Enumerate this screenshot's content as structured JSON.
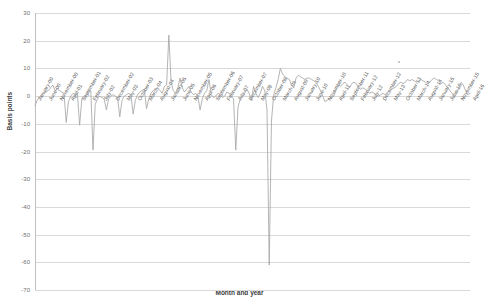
{
  "chart_data": {
    "type": "line",
    "title": "",
    "xlabel": "Month and year",
    "ylabel": "Basis points",
    "ylim": [
      -70,
      30
    ],
    "ytick_values": [
      30,
      20,
      10,
      0,
      -10,
      -20,
      -30,
      -40,
      -50,
      -60,
      -70
    ],
    "ytick_labels": [
      "30",
      "20",
      "10",
      "0",
      "-10",
      "-20",
      "-30",
      "-40",
      "-50",
      "-60",
      "-70"
    ],
    "grid": true,
    "legend": "none",
    "series_name": "Spread",
    "series_color": "#a6a6a6",
    "x_tick_interval_months": 5,
    "xtick_labels": [
      "January-00",
      "June-00",
      "November-00",
      "April-01",
      "September-01",
      "February-02",
      "July-02",
      "December-02",
      "May-03",
      "October-03",
      "March-04",
      "August-04",
      "January-05",
      "June-05",
      "November-05",
      "April-06",
      "September-06",
      "February-07",
      "July-07",
      "December-07",
      "May-08",
      "October-08",
      "March-09",
      "August-09",
      "January-10",
      "June-10",
      "November-10",
      "April-11",
      "September-11",
      "February-12",
      "July-12",
      "December-12",
      "May-13",
      "October-13",
      "March-14",
      "August-14",
      "January-15",
      "June-15",
      "November-15",
      "April-16"
    ],
    "x": [
      "January-00",
      "February-00",
      "March-00",
      "April-00",
      "May-00",
      "June-00",
      "July-00",
      "August-00",
      "September-00",
      "October-00",
      "November-00",
      "December-00",
      "January-01",
      "February-01",
      "March-01",
      "April-01",
      "May-01",
      "June-01",
      "July-01",
      "August-01",
      "September-01",
      "October-01",
      "November-01",
      "December-01",
      "January-02",
      "February-02",
      "March-02",
      "April-02",
      "May-02",
      "June-02",
      "July-02",
      "August-02",
      "September-02",
      "October-02",
      "November-02",
      "December-02",
      "January-03",
      "February-03",
      "March-03",
      "April-03",
      "May-03",
      "June-03",
      "July-03",
      "August-03",
      "September-03",
      "October-03",
      "November-03",
      "December-03",
      "January-04",
      "February-04",
      "March-04",
      "April-04",
      "May-04",
      "June-04",
      "July-04",
      "August-04",
      "September-04",
      "October-04",
      "November-04",
      "December-04",
      "January-05",
      "February-05",
      "March-05",
      "April-05",
      "May-05",
      "June-05",
      "July-05",
      "August-05",
      "September-05",
      "October-05",
      "November-05",
      "December-05",
      "January-06",
      "February-06",
      "March-06",
      "April-06",
      "May-06",
      "June-06",
      "July-06",
      "August-06",
      "September-06",
      "October-06",
      "November-06",
      "December-06",
      "January-07",
      "February-07",
      "March-07",
      "April-07",
      "May-07",
      "June-07",
      "July-07",
      "August-07",
      "September-07",
      "October-07",
      "November-07",
      "December-07",
      "January-08",
      "February-08",
      "March-08",
      "April-08",
      "May-08",
      "June-08",
      "July-08",
      "August-08",
      "September-08",
      "October-08",
      "November-08",
      "December-08",
      "January-09",
      "February-09",
      "March-09",
      "April-09",
      "May-09",
      "June-09",
      "July-09",
      "August-09",
      "September-09",
      "October-09",
      "November-09",
      "December-09",
      "January-10",
      "February-10",
      "March-10",
      "April-10",
      "May-10",
      "June-10",
      "July-10",
      "August-10",
      "September-10",
      "October-10",
      "November-10",
      "December-10",
      "January-11",
      "February-11",
      "March-11",
      "April-11",
      "May-11",
      "June-11",
      "July-11",
      "August-11",
      "September-11",
      "October-11",
      "November-11",
      "December-11",
      "January-12",
      "February-12",
      "March-12",
      "April-12",
      "May-12",
      "June-12",
      "July-12",
      "August-12",
      "September-12",
      "October-12",
      "November-12",
      "December-12",
      "January-13",
      "February-13",
      "March-13",
      "April-13",
      "May-13",
      "June-13",
      "July-13",
      "August-13",
      "September-13",
      "October-13",
      "November-13",
      "December-13",
      "January-14",
      "February-14",
      "March-14",
      "April-14",
      "May-14",
      "June-14",
      "July-14",
      "August-14",
      "September-14",
      "October-14",
      "November-14",
      "December-14",
      "January-15",
      "February-15",
      "March-15",
      "April-15",
      "May-15",
      "June-15",
      "July-15",
      "August-15",
      "September-15",
      "October-15",
      "November-15",
      "December-15",
      "January-16",
      "February-16",
      "March-16",
      "April-16"
    ],
    "values": [
      -3.5,
      -1.5,
      -0.5,
      0.5,
      1.0,
      1.5,
      2.0,
      3.0,
      4.0,
      2.0,
      2.5,
      2.0,
      1.5,
      1.0,
      -9.5,
      -2.0,
      0.0,
      1.0,
      0.5,
      1.0,
      -10.5,
      -1.0,
      0.0,
      0.5,
      1.5,
      2.0,
      -19.5,
      -3.0,
      -1.0,
      0.0,
      -0.5,
      -1.0,
      -5.0,
      -1.0,
      0.0,
      0.5,
      0.0,
      -0.5,
      -7.5,
      -1.5,
      0.0,
      0.5,
      1.0,
      0.5,
      -6.5,
      -1.5,
      0.5,
      1.5,
      2.0,
      2.5,
      -4.5,
      -1.0,
      1.0,
      2.0,
      2.5,
      3.0,
      2.0,
      1.0,
      3.5,
      4.0,
      22.0,
      5.0,
      2.0,
      1.0,
      3.0,
      6.5,
      3.0,
      1.5,
      2.5,
      3.5,
      1.5,
      0.5,
      1.0,
      0.0,
      -5.0,
      -1.0,
      1.0,
      2.0,
      6.0,
      0.5,
      -0.5,
      0.0,
      1.0,
      0.5,
      -0.5,
      0.0,
      1.5,
      1.0,
      0.0,
      -1.0,
      -19.5,
      -4.0,
      -1.0,
      0.0,
      1.0,
      2.5,
      1.0,
      -1.5,
      3.5,
      1.0,
      -0.5,
      1.0,
      3.5,
      2.0,
      -5.0,
      -61.0,
      -9.0,
      0.5,
      3.0,
      6.0,
      10.0,
      8.0,
      7.0,
      6.5,
      6.0,
      4.0,
      3.0,
      6.5,
      7.5,
      7.0,
      6.5,
      6.0,
      6.5,
      6.5,
      6.0,
      5.5,
      5.0,
      3.5,
      2.0,
      0.0,
      -2.0,
      -1.5,
      -1.0,
      -0.5,
      0.0,
      2.5,
      4.0,
      3.5,
      4.5,
      5.0,
      4.0,
      3.0,
      4.5,
      5.0,
      4.5,
      3.0,
      2.5,
      3.0,
      2.5,
      2.0,
      1.0,
      1.5,
      1.0,
      0.5,
      0.0,
      0.5,
      1.0,
      0.5,
      1.5,
      2.0,
      2.5,
      3.0,
      3.5,
      4.5,
      5.0,
      4.5,
      5.0,
      6.0,
      5.5,
      6.0,
      5.5,
      5.0,
      5.5,
      6.0,
      5.5,
      5.0,
      4.5,
      5.0,
      6.0,
      6.5,
      6.0,
      5.5,
      4.5,
      5.0,
      4.0,
      3.0,
      2.0,
      1.0,
      -0.5,
      1.0,
      3.0,
      5.0,
      4.0,
      2.0,
      0.5,
      1.0
    ]
  },
  "plot": {
    "left": 35,
    "right": 470,
    "top": 13,
    "bottom": 290
  }
}
